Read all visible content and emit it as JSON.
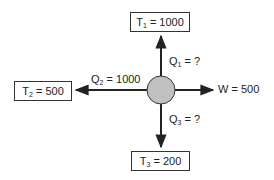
{
  "diagram": {
    "type": "heat-engine-energy-flow",
    "center": {
      "shape": "circle",
      "fill": "#c0c0c0"
    },
    "reservoirs": {
      "t1": {
        "symbol": "T",
        "sub": "1",
        "value": "= 1000"
      },
      "t2": {
        "symbol": "T",
        "sub": "2",
        "value": "= 500"
      },
      "t3": {
        "symbol": "T",
        "sub": "3",
        "value": "= 200"
      }
    },
    "flows": {
      "q1": {
        "symbol": "Q",
        "sub": "1",
        "value": "= ?",
        "direction": "up"
      },
      "q2": {
        "symbol": "Q",
        "sub": "2",
        "value": "= 1000",
        "direction": "left"
      },
      "q3": {
        "symbol": "Q",
        "sub": "3",
        "value": "= ?",
        "direction": "down"
      },
      "w": {
        "label": "W = 500",
        "direction": "right"
      }
    }
  }
}
